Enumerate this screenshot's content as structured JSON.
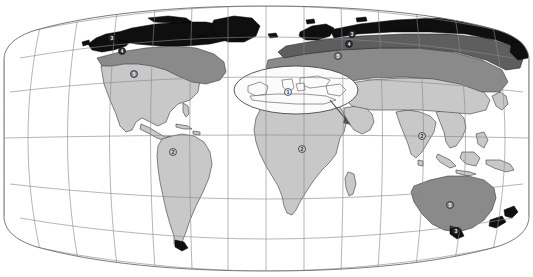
{
  "figure": {
    "kind": "world-thematic-map",
    "projection": "pseudocylindrical",
    "background_color": "#ffffff",
    "frame_color": "#6a6a6a",
    "graticule_color": "#8a8a8a",
    "coast_color": "#3a3a3a"
  },
  "legend_classes": [
    {
      "id": "class-black",
      "name": "zone-black",
      "color": "#101010"
    },
    {
      "id": "class-dark-gray",
      "name": "zone-dark-gray",
      "color": "#7d7d7d"
    },
    {
      "id": "class-mid-gray",
      "name": "zone-mid-gray",
      "color": "#9a9a9a"
    },
    {
      "id": "class-light-gray",
      "name": "zone-light-gray",
      "color": "#c9c9c9"
    },
    {
      "id": "class-white",
      "name": "zone-white",
      "color": "#f6f6f6"
    }
  ],
  "markers": [
    {
      "id": "m-alaska",
      "region": "alaska",
      "label": "3",
      "x": 112,
      "y": 38,
      "fill": "#2a2a2a",
      "text": "light"
    },
    {
      "id": "m-nw-canada",
      "region": "northwest-canada",
      "label": "4",
      "x": 122,
      "y": 51,
      "fill": "#2a2a2a",
      "text": "light"
    },
    {
      "id": "m-usa",
      "region": "united-states",
      "label": "5",
      "x": 134,
      "y": 74,
      "fill": "#8b8b8b",
      "text": "light"
    },
    {
      "id": "m-scandinavia",
      "region": "northern-europe",
      "label": "3",
      "x": 352,
      "y": 34,
      "fill": "#2a2a2a",
      "text": "light"
    },
    {
      "id": "m-west-siberia",
      "region": "western-siberia",
      "label": "4",
      "x": 349,
      "y": 44,
      "fill": "#2a2a2a",
      "text": "light"
    },
    {
      "id": "m-central-asia",
      "region": "central-asia",
      "label": "5",
      "x": 338,
      "y": 56,
      "fill": "#8b8b8b",
      "text": "light"
    },
    {
      "id": "m-mediterranean",
      "region": "mediterranean",
      "label": "1",
      "x": 288,
      "y": 92,
      "fill": "#f2f2f2",
      "text": "dark"
    },
    {
      "id": "m-south-america",
      "region": "south-america",
      "label": "2",
      "x": 173,
      "y": 152,
      "fill": "#cdcdcd",
      "text": "dark"
    },
    {
      "id": "m-africa",
      "region": "africa",
      "label": "2",
      "x": 302,
      "y": 149,
      "fill": "#cdcdcd",
      "text": "dark"
    },
    {
      "id": "m-south-asia",
      "region": "south-asia",
      "label": "2",
      "x": 422,
      "y": 136,
      "fill": "#cdcdcd",
      "text": "dark"
    },
    {
      "id": "m-australia",
      "region": "australia",
      "label": "5",
      "x": 450,
      "y": 205,
      "fill": "#8b8b8b",
      "text": "light"
    },
    {
      "id": "m-tasmania",
      "region": "tasmania",
      "label": "3",
      "x": 456,
      "y": 231,
      "fill": "#2a2a2a",
      "text": "light"
    }
  ]
}
